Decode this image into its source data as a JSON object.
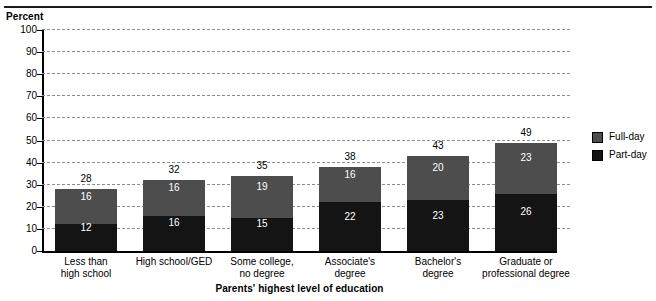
{
  "chart_data": {
    "type": "bar",
    "title": "",
    "subtitle": "",
    "xlabel": "Parents' highest level of education",
    "ylabel": "Percent",
    "ylim": [
      0,
      100
    ],
    "ytick_step": 10,
    "yticks": [
      "0",
      "10",
      "20",
      "30",
      "40",
      "50",
      "60",
      "70",
      "80",
      "90",
      "100"
    ],
    "grid": true,
    "stacked": true,
    "legend_position": "right",
    "categories": [
      "Less than high school",
      "High school/GED",
      "Some college, no degree",
      "Associate's degree",
      "Bachelor's degree",
      "Graduate or professional degree"
    ],
    "category_lines": [
      [
        "Less than",
        "high school"
      ],
      [
        "High school/GED"
      ],
      [
        "Some college,",
        "no degree"
      ],
      [
        "Associate's",
        "degree"
      ],
      [
        "Bachelor's",
        "degree"
      ],
      [
        "Graduate or",
        "professional degree"
      ]
    ],
    "series": [
      {
        "name": "Part-day",
        "color": "#141414",
        "values": [
          12,
          16,
          15,
          22,
          23,
          26
        ]
      },
      {
        "name": "Full-day",
        "color": "#4d4d4d",
        "values": [
          16,
          16,
          19,
          16,
          20,
          23
        ]
      }
    ],
    "totals": [
      28,
      32,
      35,
      38,
      43,
      49
    ]
  },
  "legend": {
    "items": [
      {
        "label": "Full-day",
        "color": "#4d4d4d"
      },
      {
        "label": "Part-day",
        "color": "#141414"
      }
    ]
  }
}
